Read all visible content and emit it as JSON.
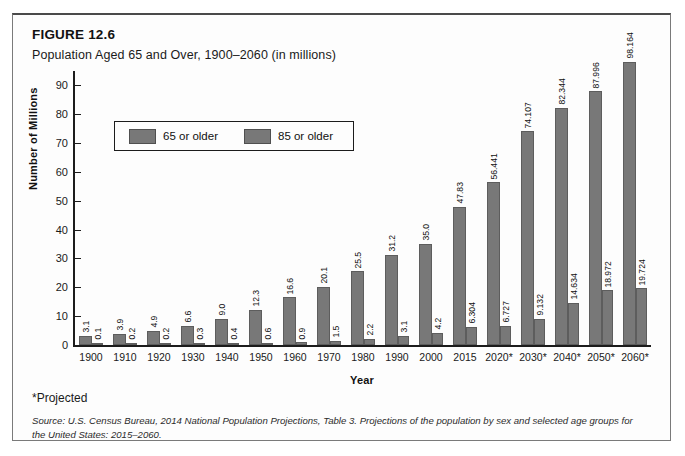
{
  "figure": {
    "label": "FIGURE 12.6",
    "title": "Population Aged 65 and Over, 1900–2060 (in millions)",
    "projected_note": "*Projected",
    "source": "Source: U.S. Census Bureau, 2014 National Population Projections, Table 3. Projections of the population by sex and selected age groups for the United States: 2015–2060."
  },
  "legend": {
    "items": [
      {
        "label": "65 or older",
        "color": "#787878"
      },
      {
        "label": "85 or older",
        "color": "#787878"
      }
    ]
  },
  "chart_data": {
    "type": "bar",
    "title": "Population Aged 65 and Over, 1900–2060 (in millions)",
    "xlabel": "Year",
    "ylabel": "Number of Millions",
    "ylim": [
      0,
      95
    ],
    "yticks": [
      0,
      10,
      20,
      30,
      40,
      50,
      60,
      70,
      80,
      90
    ],
    "ytick_labels": [
      "0",
      "10",
      "20",
      "30",
      "40",
      "50",
      "60",
      "70",
      "80",
      "90"
    ],
    "grid": false,
    "legend_position": "upper-left-inside",
    "categories": [
      "1900",
      "1910",
      "1920",
      "1930",
      "1940",
      "1950",
      "1960",
      "1970",
      "1980",
      "1990",
      "2000",
      "2015",
      "2020*",
      "2030*",
      "2040*",
      "2050*",
      "2060*"
    ],
    "series": [
      {
        "name": "65 or older",
        "color": "#787878",
        "values": [
          3.1,
          3.9,
          4.9,
          6.6,
          9.0,
          12.3,
          16.6,
          20.1,
          25.5,
          31.2,
          35.0,
          47.83,
          56.441,
          74.107,
          82.344,
          87.996,
          98.164
        ],
        "labels": [
          "3.1",
          "3.9",
          "4.9",
          "6.6",
          "9.0",
          "12.3",
          "16.6",
          "20.1",
          "25.5",
          "31.2",
          "35.0",
          "47.83",
          "56.441",
          "74.107",
          "82.344",
          "87.996",
          "98.164"
        ]
      },
      {
        "name": "85 or older",
        "color": "#787878",
        "values": [
          0.1,
          0.2,
          0.2,
          0.3,
          0.4,
          0.6,
          0.9,
          1.5,
          2.2,
          3.1,
          4.2,
          6.304,
          6.727,
          9.132,
          14.634,
          18.972,
          19.724
        ],
        "labels": [
          "0.1",
          "0.2",
          "0.2",
          "0.3",
          "0.4",
          "0.6",
          "0.9",
          "1.5",
          "2.2",
          "3.1",
          "4.2",
          "6.304",
          "6.727",
          "9.132",
          "14.634",
          "18.972",
          "19.724"
        ]
      }
    ]
  }
}
